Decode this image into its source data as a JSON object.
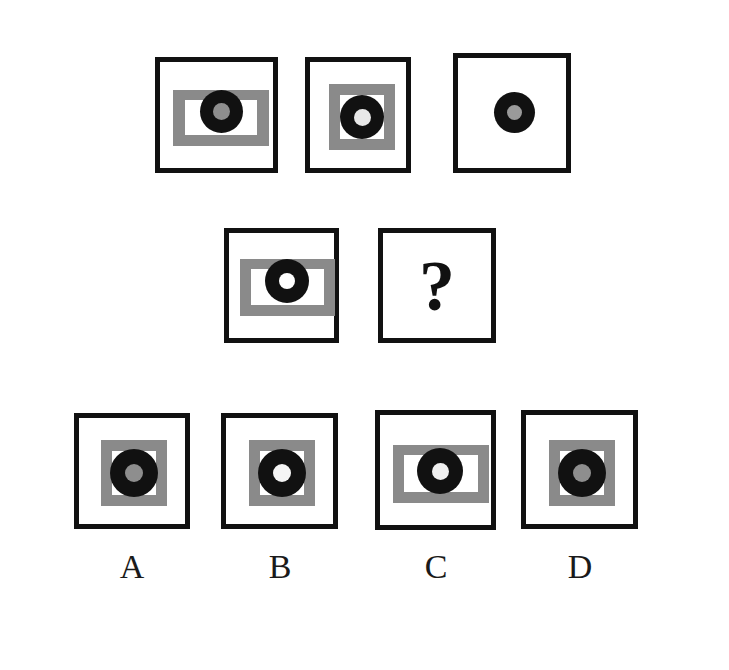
{
  "puzzle": {
    "type": "visual-analogy-matrix",
    "colors": {
      "background": "#ffffff",
      "frame_stroke": "#111111",
      "plate_gray": "#8a8a8a",
      "disc_black": "#111111",
      "pupil_gray": "#8a8a8a",
      "pupil_white": "#ffffff",
      "label_text": "#1a1a1a"
    },
    "question_mark": "?",
    "stimulus_rows": [
      {
        "row_name": "top-row",
        "cells": [
          {
            "id": "top-1",
            "frame": true,
            "plate_shape": "wide-rectangle",
            "window_shape": "wide-rectangle",
            "disc": true,
            "pupil_color": "gray",
            "description": "black frame, gray wide rectangle, white wide window, black disc with gray pupil"
          },
          {
            "id": "top-2",
            "frame": true,
            "plate_shape": "square",
            "window_shape": "square",
            "disc": true,
            "pupil_color": "gray",
            "description": "black frame, gray square, white square window, black disc with gray pupil"
          },
          {
            "id": "top-3",
            "frame": true,
            "plate_shape": "none",
            "window_shape": "none",
            "disc": true,
            "pupil_color": "gray",
            "description": "black frame, empty white field, black disc with gray pupil"
          }
        ]
      },
      {
        "row_name": "middle-row",
        "cells": [
          {
            "id": "mid-1",
            "frame": true,
            "plate_shape": "wide-rectangle",
            "window_shape": "wide-rectangle",
            "disc": true,
            "pupil_color": "white",
            "description": "black frame, gray wide rectangle, white wide window, black disc with white pupil"
          },
          {
            "id": "mid-2-question",
            "frame": true,
            "plate_shape": "none",
            "window_shape": "none",
            "disc": false,
            "pupil_color": "none",
            "description": "black frame containing a question mark"
          }
        ]
      }
    ],
    "options": [
      {
        "id": "option-a",
        "label": "A",
        "frame": true,
        "plate_shape": "square",
        "window_shape": "square",
        "disc": true,
        "pupil_color": "gray",
        "description": "black frame, gray square, white square window, black disc with gray pupil"
      },
      {
        "id": "option-b",
        "label": "B",
        "frame": true,
        "plate_shape": "square",
        "window_shape": "square",
        "disc": true,
        "pupil_color": "white",
        "description": "black frame, gray square, white square window, black disc with white pupil"
      },
      {
        "id": "option-c",
        "label": "C",
        "frame": true,
        "plate_shape": "wide-rectangle",
        "window_shape": "wide-rectangle",
        "disc": true,
        "pupil_color": "white",
        "description": "black frame, gray wide rectangle, white wide window, black disc with white pupil"
      },
      {
        "id": "option-d",
        "label": "D",
        "frame": true,
        "plate_shape": "square",
        "window_shape": "square",
        "disc": true,
        "pupil_color": "gray",
        "description": "black frame, gray square, white square window, black disc with gray pupil"
      }
    ]
  }
}
